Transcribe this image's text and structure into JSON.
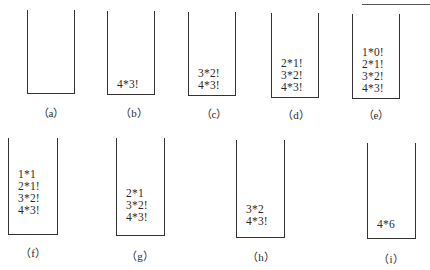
{
  "figure": {
    "stacks": [
      {
        "id": "a",
        "label": "（a）",
        "items": []
      },
      {
        "id": "b",
        "label": "（b）",
        "items": [
          "4*3!"
        ]
      },
      {
        "id": "c",
        "label": "（c）",
        "items": [
          "3*2!",
          "4*3!"
        ]
      },
      {
        "id": "d",
        "label": "（d）",
        "items": [
          "2*1!",
          "3*2!",
          "4*3!"
        ]
      },
      {
        "id": "e",
        "label": "（e）",
        "items": [
          "1*0!",
          "2*1!",
          "3*2!",
          "4*3!"
        ]
      },
      {
        "id": "f",
        "label": "（f）",
        "items": [
          "1*1",
          "2*1!",
          "3*2!",
          "4*3!"
        ]
      },
      {
        "id": "g",
        "label": "（g）",
        "items": [
          "2*1",
          "3*2!",
          "4*3!"
        ]
      },
      {
        "id": "h",
        "label": "（h）",
        "items": [
          "3*2",
          "4*3!"
        ]
      },
      {
        "id": "i",
        "label": "（i）",
        "items": [
          "4*6"
        ]
      }
    ]
  },
  "colors": {
    "line": "#333333",
    "text": "#2a2a2a",
    "background": "#ffffff"
  }
}
